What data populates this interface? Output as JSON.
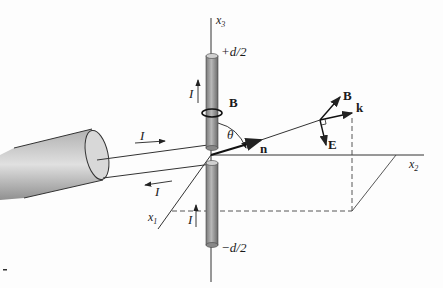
{
  "diagram": {
    "type": "dipole antenna radiation geometry",
    "axes": {
      "x1": {
        "base": "x",
        "sub": "1"
      },
      "x2": {
        "base": "x",
        "sub": "2"
      },
      "x3": {
        "base": "x",
        "sub": "3"
      }
    },
    "antenna": {
      "top_label": "+d/2",
      "bottom_label": "−d/2",
      "current_label": "I"
    },
    "feed_line": {
      "upper_current": "I",
      "lower_current": "I"
    },
    "field_labels": {
      "loop_B": "B",
      "angle": "θ",
      "normal": "n",
      "wave_B": "B",
      "wave_k": "k",
      "wave_E": "E"
    },
    "colors": {
      "line": "#222222",
      "rod_dark": "#6a6a6a",
      "rod_light": "#c8c8c8",
      "cable_dark": "#7a7a7a",
      "cable_light": "#d8d8d8"
    }
  }
}
